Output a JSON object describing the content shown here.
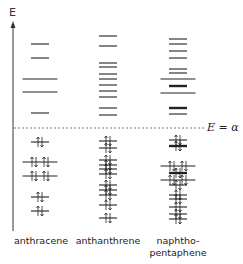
{
  "axis": {
    "label": "E"
  },
  "reference_line": {
    "label": "E = α",
    "y": 128
  },
  "molecules": [
    {
      "name": "anthracene",
      "label": "anthracene",
      "label_lines": [
        "anthracene"
      ],
      "cx": 40,
      "unoccupied": [
        {
          "y": 44,
          "w": 18
        },
        {
          "y": 58,
          "w": 18
        },
        {
          "y": 79,
          "w": 35
        },
        {
          "y": 92,
          "w": 35
        },
        {
          "y": 113,
          "w": 18
        }
      ],
      "occupied": [
        {
          "y": 142,
          "w": 18,
          "pairs": 1
        },
        {
          "y": 162,
          "w": 35,
          "pairs": 2
        },
        {
          "y": 176,
          "w": 35,
          "pairs": 2
        },
        {
          "y": 197,
          "w": 18,
          "pairs": 1
        },
        {
          "y": 211,
          "w": 18,
          "pairs": 1
        }
      ]
    },
    {
      "name": "anthanthrene",
      "label": "anthanthrene",
      "label_lines": [
        "anthanthrene"
      ],
      "cx": 108,
      "unoccupied": [
        {
          "y": 36,
          "w": 18
        },
        {
          "y": 46,
          "w": 18
        },
        {
          "y": 63,
          "w": 18
        },
        {
          "y": 67,
          "w": 18
        },
        {
          "y": 74,
          "w": 18
        },
        {
          "y": 79,
          "w": 18
        },
        {
          "y": 85,
          "w": 18
        },
        {
          "y": 91,
          "w": 18
        },
        {
          "y": 97,
          "w": 18
        },
        {
          "y": 108,
          "w": 18
        },
        {
          "y": 115,
          "w": 18
        }
      ],
      "occupied": [
        {
          "y": 141,
          "w": 18,
          "pairs": 1
        },
        {
          "y": 148,
          "w": 18,
          "pairs": 1
        },
        {
          "y": 160,
          "w": 18,
          "pairs": 1
        },
        {
          "y": 165,
          "w": 18,
          "pairs": 1
        },
        {
          "y": 169,
          "w": 18,
          "pairs": 1
        },
        {
          "y": 174,
          "w": 18,
          "pairs": 1
        },
        {
          "y": 185,
          "w": 18,
          "pairs": 1
        },
        {
          "y": 190,
          "w": 18,
          "pairs": 1
        },
        {
          "y": 195,
          "w": 18,
          "pairs": 1
        },
        {
          "y": 205,
          "w": 18,
          "pairs": 1
        },
        {
          "y": 218,
          "w": 18,
          "pairs": 1
        }
      ]
    },
    {
      "name": "naphthopentaphene",
      "label": "naphtho-pentaphene",
      "label_lines": [
        "naphtho-",
        "pentaphene"
      ],
      "cx": 178,
      "unoccupied": [
        {
          "y": 39,
          "w": 18
        },
        {
          "y": 44,
          "w": 18
        },
        {
          "y": 51,
          "w": 18
        },
        {
          "y": 58,
          "w": 18
        },
        {
          "y": 69,
          "w": 18
        },
        {
          "y": 73,
          "w": 18
        },
        {
          "y": 79,
          "w": 35
        },
        {
          "y": 86,
          "w": 18,
          "bold": true
        },
        {
          "y": 93,
          "w": 35
        },
        {
          "y": 108,
          "w": 18,
          "bold": true
        },
        {
          "y": 114,
          "w": 18
        }
      ],
      "occupied": [
        {
          "y": 140,
          "w": 18,
          "pairs": 1
        },
        {
          "y": 146,
          "w": 18,
          "pairs": 1,
          "bold": true
        },
        {
          "y": 166,
          "w": 35,
          "pairs": 2
        },
        {
          "y": 173,
          "w": 18,
          "pairs": 1,
          "bold": true
        },
        {
          "y": 180,
          "w": 35,
          "pairs": 2
        },
        {
          "y": 185,
          "w": 18,
          "pairs": 1
        },
        {
          "y": 195,
          "w": 18,
          "pairs": 1
        },
        {
          "y": 199,
          "w": 18,
          "pairs": 1
        },
        {
          "y": 207,
          "w": 18,
          "pairs": 1
        },
        {
          "y": 214,
          "w": 18,
          "pairs": 1
        },
        {
          "y": 219,
          "w": 18,
          "pairs": 1
        }
      ]
    }
  ]
}
